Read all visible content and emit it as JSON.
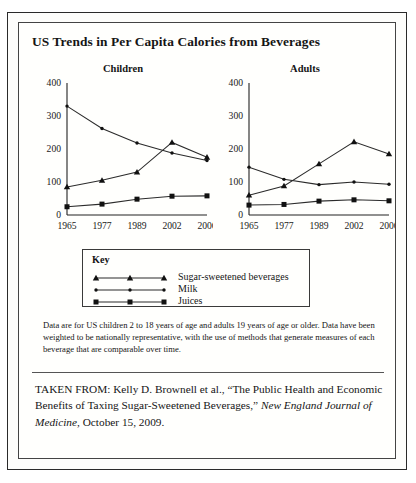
{
  "figure": {
    "title": "US Trends in Per Capita Calories from Beverages",
    "caption": "Data are for US children 2 to 18 years of age and adults 19 years of age or older. Data have been weighted to be nationally representative, with the use of methods that generate measures of each beverage that are comparable over time.",
    "source_prefix": "TAKEN FROM: Kelly D. Brownell et al., “The Public Health and Economic Benefits of Taxing Sugar-Sweetened Beverages,” ",
    "source_journal": "New England Journal of Medicine",
    "source_suffix": ", October 15, 2009."
  },
  "legend": {
    "title": "Key",
    "items": [
      {
        "label": "Sugar-sweetened beverages",
        "marker": "triangle-marker"
      },
      {
        "label": "Milk",
        "marker": "dot-marker"
      },
      {
        "label": "Juices",
        "marker": "square-marker"
      }
    ]
  },
  "chart_data": [
    {
      "type": "line",
      "title": "Children",
      "xlabel": "",
      "ylabel": "",
      "categories": [
        "1965",
        "1977",
        "1989",
        "2002",
        "2006"
      ],
      "ylim": [
        0,
        400
      ],
      "yticks": [
        0,
        100,
        200,
        300,
        400
      ],
      "grid": false,
      "legend_position": "below",
      "series": [
        {
          "name": "Milk",
          "marker": "dot-marker",
          "values": [
            330,
            262,
            218,
            188,
            165
          ]
        },
        {
          "name": "Sugar-sweetened beverages",
          "marker": "triangle-marker",
          "values": [
            85,
            105,
            130,
            220,
            175
          ]
        },
        {
          "name": "Juices",
          "marker": "square-marker",
          "values": [
            25,
            33,
            48,
            57,
            58
          ]
        }
      ]
    },
    {
      "type": "line",
      "title": "Adults",
      "xlabel": "",
      "ylabel": "",
      "categories": [
        "1965",
        "1977",
        "1989",
        "2002",
        "2006"
      ],
      "ylim": [
        0,
        400
      ],
      "yticks": [
        0,
        100,
        200,
        300,
        400
      ],
      "grid": false,
      "legend_position": "below",
      "series": [
        {
          "name": "Milk",
          "marker": "dot-marker",
          "values": [
            145,
            108,
            92,
            100,
            93
          ]
        },
        {
          "name": "Sugar-sweetened beverages",
          "marker": "triangle-marker",
          "values": [
            60,
            88,
            155,
            222,
            185
          ]
        },
        {
          "name": "Juices",
          "marker": "square-marker",
          "values": [
            30,
            32,
            42,
            46,
            43
          ]
        }
      ]
    }
  ]
}
